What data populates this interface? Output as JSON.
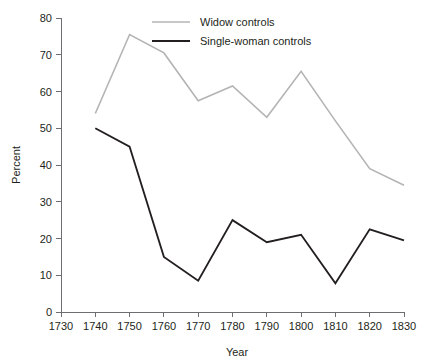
{
  "chart_data": {
    "type": "line",
    "title": "",
    "xlabel": "Year",
    "ylabel": "Percent",
    "xlim": [
      1730,
      1830
    ],
    "ylim": [
      0,
      80
    ],
    "grid": false,
    "legend_position": "top-right",
    "x": [
      1740,
      1750,
      1760,
      1770,
      1780,
      1790,
      1800,
      1810,
      1820,
      1830
    ],
    "xticks": [
      "1730",
      "1740",
      "1750",
      "1760",
      "1770",
      "1780",
      "1790",
      "1800",
      "1810",
      "1820",
      "1830"
    ],
    "xtick_values": [
      1730,
      1740,
      1750,
      1760,
      1770,
      1780,
      1790,
      1800,
      1810,
      1820,
      1830
    ],
    "yticks": [
      "0",
      "10",
      "20",
      "30",
      "40",
      "50",
      "60",
      "70",
      "80"
    ],
    "ytick_values": [
      0,
      10,
      20,
      30,
      40,
      50,
      60,
      70,
      80
    ],
    "series": [
      {
        "name": "Widow controls",
        "color": "#b4b4b4",
        "width": 1.6,
        "values": [
          54,
          75.5,
          70.5,
          57.5,
          61.5,
          53,
          65.5,
          52,
          39,
          34.5
        ]
      },
      {
        "name": "Single-woman controls",
        "color": "#231f20",
        "width": 1.8,
        "values": [
          50,
          45,
          15,
          8.5,
          25,
          19,
          21,
          7.8,
          22.5,
          19.5
        ]
      }
    ]
  },
  "legend": {
    "entries": [
      {
        "label": "Widow controls",
        "color": "#b4b4b4"
      },
      {
        "label": "Single-woman controls",
        "color": "#231f20"
      }
    ]
  },
  "axes": {
    "x_title": "Year",
    "y_title": "Percent",
    "axis_color": "#6d6e71"
  }
}
